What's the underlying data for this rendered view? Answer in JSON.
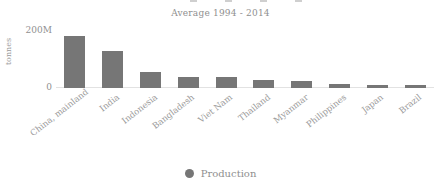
{
  "chart_data": {
    "type": "bar",
    "title": "Average 1994 - 2014",
    "xlabel": "",
    "ylabel": "tonnes",
    "categories": [
      "China, mainland",
      "India",
      "Indonesia",
      "Bangladesh",
      "Viet Nam",
      "Thailand",
      "Myanmar",
      "Philippines",
      "Japan",
      "Brazil"
    ],
    "values": [
      182000000,
      130000000,
      56000000,
      39000000,
      37000000,
      29000000,
      26000000,
      14000000,
      11000000,
      10000000
    ],
    "series": [
      {
        "name": "Production",
        "values": [
          182000000,
          130000000,
          56000000,
          39000000,
          37000000,
          29000000,
          26000000,
          14000000,
          11000000,
          10000000
        ]
      }
    ],
    "ylim": [
      0,
      200000000
    ],
    "ytick_values": [
      0,
      200000000
    ],
    "ytick_labels": [
      "0",
      "200M"
    ],
    "grid": false,
    "legend_position": "bottom",
    "legend_entries": [
      "Production"
    ],
    "bar_color": "#767676",
    "axis_color": "#e2e2e2",
    "text_color": "#9a9a9a"
  },
  "legend": {
    "marker": "circle-marker",
    "label": "Production"
  }
}
